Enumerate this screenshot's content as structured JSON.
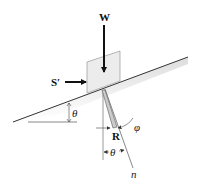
{
  "diagram": {
    "type": "free-body diagram: block on inclined plane",
    "labels": {
      "weight": "W",
      "push_force": "S′",
      "incline_angle": "θ",
      "reaction": "R",
      "friction_angle": "φ",
      "normal_angle": "θ",
      "normal_axis": "n"
    },
    "colors": {
      "line": "#333333",
      "arrow": "#111111",
      "block_fill": "#ececec",
      "block_stroke": "#999999",
      "shade": "#d8d8d8",
      "reaction_fill": "#cccccc"
    }
  }
}
